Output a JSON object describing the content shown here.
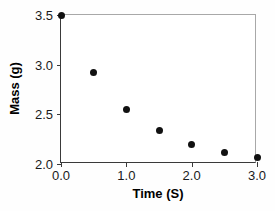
{
  "chart_data": {
    "type": "scatter",
    "title": "",
    "xlabel": "Time (S)",
    "ylabel": "Mass (g)",
    "xlim": [
      0.0,
      3.0
    ],
    "ylim": [
      2.0,
      3.5
    ],
    "xticks": [
      0.0,
      1.0,
      2.0,
      3.0
    ],
    "xticklabels": [
      "0.0",
      "1.0",
      "2.0",
      "3.0"
    ],
    "yticks": [
      2.0,
      2.5,
      3.0,
      3.5
    ],
    "yticklabels": [
      "2.0",
      "2.5",
      "3.0",
      "3.5"
    ],
    "grid": false,
    "legend": null,
    "marker": "filled-circle",
    "marker_color": "#111111",
    "axis_color": "#3a3a3a",
    "frame_color": "#a8a8a8",
    "background": "#ffffff",
    "x": [
      0.0,
      0.5,
      1.0,
      1.5,
      2.0,
      2.5,
      3.0
    ],
    "values": [
      3.5,
      2.92,
      2.55,
      2.34,
      2.2,
      2.12,
      2.07
    ],
    "points": [
      {
        "x": 0.0,
        "y": 3.5
      },
      {
        "x": 0.5,
        "y": 2.92
      },
      {
        "x": 1.0,
        "y": 2.55
      },
      {
        "x": 1.5,
        "y": 2.34
      },
      {
        "x": 2.0,
        "y": 2.2
      },
      {
        "x": 2.5,
        "y": 2.12
      },
      {
        "x": 3.0,
        "y": 2.07
      }
    ]
  }
}
